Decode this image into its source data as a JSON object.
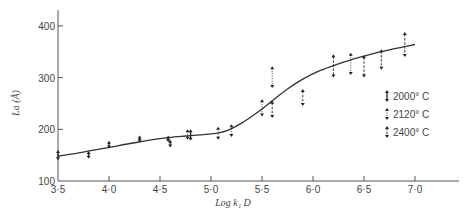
{
  "chart_data": {
    "type": "scatter",
    "title": "",
    "xlabel": "Log k₁ D",
    "ylabel": "La (Å)",
    "xlim": [
      3.5,
      7.4
    ],
    "ylim": [
      100,
      430
    ],
    "xticks": [
      3.5,
      4.0,
      4.5,
      5.0,
      5.5,
      6.0,
      6.5,
      7.0
    ],
    "xtick_labels": [
      "3·5",
      "4·0",
      "4·5",
      "5·0",
      "5·5",
      "6·0",
      "6·5",
      "7·0"
    ],
    "yticks": [
      100,
      200,
      300,
      400
    ],
    "ytick_labels": [
      "100",
      "200",
      "300",
      "400"
    ],
    "grid": false,
    "legend_position": "right-middle",
    "series": [
      {
        "name": "2000° C",
        "style": "solid",
        "points": [
          {
            "x": 3.5,
            "low": 140,
            "high": 160
          },
          {
            "x": 3.8,
            "low": 143,
            "high": 158
          },
          {
            "x": 4.0,
            "low": 163,
            "high": 178
          },
          {
            "x": 4.3,
            "low": 175,
            "high": 188
          },
          {
            "x": 4.58,
            "low": 175,
            "high": 188
          },
          {
            "x": 4.6,
            "low": 165,
            "high": 180
          },
          {
            "x": 4.8,
            "low": 178,
            "high": 200
          }
        ]
      },
      {
        "name": "2120° C",
        "style": "dotted",
        "points": [
          {
            "x": 4.77,
            "low": 180,
            "high": 200
          },
          {
            "x": 5.07,
            "low": 180,
            "high": 205
          },
          {
            "x": 5.2,
            "low": 185,
            "high": 210
          },
          {
            "x": 5.5,
            "low": 225,
            "high": 258
          },
          {
            "x": 5.6,
            "low": 280,
            "high": 322
          },
          {
            "x": 6.37,
            "low": 305,
            "high": 348
          }
        ]
      },
      {
        "name": "2400° C",
        "style": "dashed",
        "points": [
          {
            "x": 5.6,
            "low": 222,
            "high": 255
          },
          {
            "x": 5.9,
            "low": 245,
            "high": 278
          },
          {
            "x": 6.2,
            "low": 300,
            "high": 345
          },
          {
            "x": 6.5,
            "low": 300,
            "high": 343
          },
          {
            "x": 6.67,
            "low": 315,
            "high": 355
          },
          {
            "x": 6.9,
            "low": 340,
            "high": 388
          }
        ]
      }
    ],
    "fit_curve": {
      "name": "fitted curve",
      "x": [
        3.5,
        3.75,
        4.0,
        4.25,
        4.5,
        4.75,
        5.0,
        5.15,
        5.3,
        5.45,
        5.6,
        5.75,
        5.9,
        6.05,
        6.2,
        6.4,
        6.6,
        6.8,
        7.0
      ],
      "y": [
        148,
        156,
        165,
        174,
        182,
        187,
        191,
        197,
        212,
        232,
        255,
        278,
        297,
        312,
        323,
        336,
        347,
        356,
        364
      ]
    }
  },
  "legend": {
    "items": [
      {
        "label": "2000° C",
        "style": "solid"
      },
      {
        "label": "2120° C",
        "style": "dotted"
      },
      {
        "label": "2400° C",
        "style": "dashed"
      }
    ]
  },
  "axes": {
    "x_title": "Log k₁ D",
    "y_title": "La (Å)"
  }
}
